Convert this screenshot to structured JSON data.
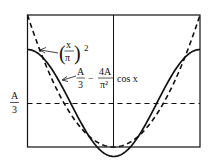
{
  "figure": {
    "curves": [
      {
        "name": "parabola",
        "style": "dashed",
        "label": "(x/π)²",
        "expr": "(x/pi)^2"
      },
      {
        "name": "cosine-approx",
        "style": "solid",
        "label": "A/3 − 4A/π² cos x",
        "expr": "A/3 - (4A/pi^2) cos x"
      }
    ],
    "reference_line": {
      "style": "dashed",
      "label_num": "A",
      "label_den": "3"
    },
    "labels": {
      "parabola_x": "x",
      "parabola_pi": "π",
      "parabola_exp": "2",
      "cos_A": "A",
      "cos_3": "3",
      "minus": "−",
      "cos_4A": "4A",
      "cos_pi2": "π²",
      "cos_tail": "cos x",
      "axis_A": "A",
      "axis_3": "3"
    },
    "colors": {
      "stroke": "#111111",
      "background": "#ffffff"
    }
  }
}
